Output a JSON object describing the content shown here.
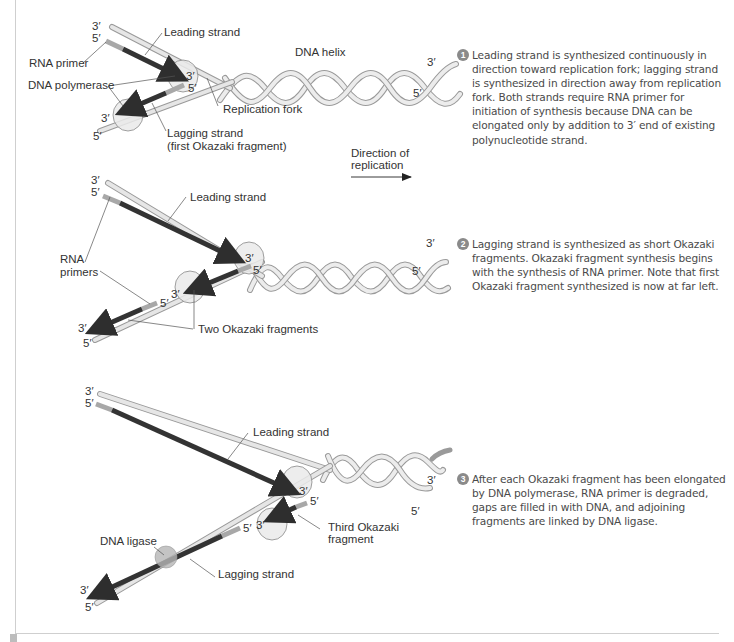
{
  "panels": [
    {
      "id": 1,
      "labels": {
        "top_3prime": "3′",
        "top_5prime": "5′",
        "leading_strand": "Leading strand",
        "rna_primer": "RNA primer",
        "dna_polymerase": "DNA polymerase",
        "leading_3prime": "3′",
        "lagging_5prime": "5′",
        "bottom_3prime": "3′",
        "bottom_5prime": "5′",
        "dna_helix": "DNA helix",
        "helix_3prime": "3′",
        "helix_5prime": "5′",
        "replication_fork": "Replication fork",
        "lagging_strand": "Lagging strand",
        "lagging_strand_note": "(first Okazaki fragment)"
      },
      "step_number": "1",
      "description": "Leading strand is synthesized continuously in direction toward replication fork; lagging strand is synthesized in direction away from replication fork. Both strands require RNA primer for initiation of synthesis because DNA can be elongated only by addition to 3′ end of existing polynucleotide strand."
    },
    {
      "id": 2,
      "labels": {
        "top_3prime": "3′",
        "top_5prime": "5′",
        "leading_strand": "Leading strand",
        "rna_primers_line1": "RNA",
        "rna_primers_line2": "primers",
        "leading_3prime": "3′",
        "lagging_5prime": "5′",
        "frag_5prime": "5′",
        "frag_3prime": "3′",
        "bottom_3prime": "3′",
        "bottom_5prime": "5′",
        "helix_3prime": "3′",
        "helix_5prime": "5′",
        "two_okazaki": "Two Okazaki fragments"
      },
      "step_number": "2",
      "description": "Lagging strand is synthesized as short Okazaki fragments. Okazaki fragment synthesis begins with the synthesis of RNA primer. Note that first Okazaki fragment synthesized is now at far left."
    },
    {
      "id": 3,
      "labels": {
        "top_3prime": "3′",
        "top_5prime": "5′",
        "leading_strand": "Leading strand",
        "leading_3prime": "3′",
        "lagging_5prime": "5′",
        "frag_5prime": "5′",
        "frag_3prime": "3′",
        "bottom_3prime": "3′",
        "bottom_5prime": "5′",
        "helix_3prime": "3′",
        "helix_5prime": "5′",
        "dna_ligase": "DNA ligase",
        "lagging_strand": "Lagging strand",
        "third_okazaki_line1": "Third Okazaki",
        "third_okazaki_line2": "fragment"
      },
      "step_number": "3",
      "description": "After each Okazaki fragment has been elongated by DNA polymerase, RNA primer is degraded, gaps are filled in with DNA, and adjoining fragments are linked by DNA ligase."
    }
  ],
  "direction": {
    "line1": "Direction of",
    "line2": "replication"
  },
  "colors": {
    "template_strand": "#e4e4e4",
    "template_outline": "#9a9a9a",
    "new_dna": "#3a3a3a",
    "rna_primer": "#a8a8a8",
    "enzyme": "#e9e9e9",
    "ligase": "#bdbdbd",
    "badge": "#8a8a8a"
  }
}
